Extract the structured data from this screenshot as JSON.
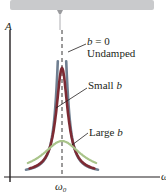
{
  "chart_data": {
    "type": "line",
    "title": "",
    "xlabel": "ω",
    "ylabel": "A",
    "x_tick_labels": [
      "ω0"
    ],
    "resonance_marker": "ω0",
    "grid": false,
    "series": [
      {
        "name": "b = 0 Undamped",
        "label_line1": "b = 0",
        "label_line2": "Undamped",
        "peak_relative": 1.0,
        "color": "#6f7f91",
        "note": "diverges at ω0"
      },
      {
        "name": "Small b",
        "label": "Small b",
        "peak_relative": 0.78,
        "color": "#7d2a33"
      },
      {
        "name": "Large b",
        "label": "Large b",
        "peak_relative": 0.22,
        "color": "#a9c48a"
      }
    ]
  },
  "support_bar_color": "#c9cacc",
  "axis_color": "#231f20"
}
